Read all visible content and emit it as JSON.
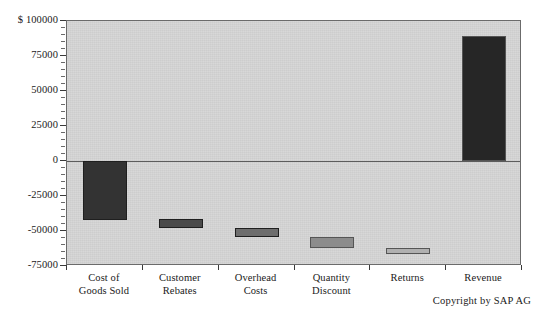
{
  "chart_data": {
    "type": "bar",
    "title": "",
    "subtitle": "",
    "xlabel": "",
    "ylabel": "$",
    "currency_prefix": "$",
    "categories": [
      "Cost of\nGoods Sold",
      "Customer\nRebates",
      "Overhead\nCosts",
      "Quantity\nDiscount",
      "Returns",
      "Revenue"
    ],
    "waterfall_segments": [
      {
        "label": "Cost of Goods Sold",
        "start": 0,
        "end": -42000,
        "value": -42000,
        "color": "#333333"
      },
      {
        "label": "Customer Rebates",
        "start": -41500,
        "end": -48000,
        "value": -6500,
        "color": "#4a4a4a"
      },
      {
        "label": "Overhead Costs",
        "start": -48000,
        "end": -54000,
        "value": -6000,
        "color": "#6e6e6e"
      },
      {
        "label": "Quantity Discount",
        "start": -54000,
        "end": -62500,
        "value": -8500,
        "color": "#8c8c8c"
      },
      {
        "label": "Returns",
        "start": -62000,
        "end": -66500,
        "value": -4500,
        "color": "#b0b0b0"
      },
      {
        "label": "Revenue",
        "start": 0,
        "end": 89000,
        "value": 89000,
        "color": "#262626"
      }
    ],
    "values": [
      -42000,
      -6500,
      -6000,
      -8500,
      -4500,
      89000
    ],
    "ytick_labels": [
      "$ 100000",
      "75000",
      "50000",
      "25000",
      "0",
      "-25000",
      "-50000",
      "-75000"
    ],
    "ytick_values": [
      100000,
      75000,
      50000,
      25000,
      0,
      -25000,
      -50000,
      -75000
    ],
    "ylim": [
      -75000,
      100000
    ],
    "minor_tick_step": 5000,
    "grid": false,
    "legend": null,
    "legend_position": "none",
    "plot_background": "#d4d4d4",
    "axis_color": "#6b6b6b",
    "page_background": "#ffffff"
  },
  "footer": {
    "copyright": "Copyright by SAP AG"
  }
}
